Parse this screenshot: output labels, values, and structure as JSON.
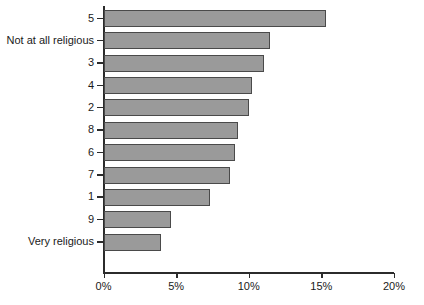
{
  "chart_data": {
    "type": "bar",
    "orientation": "horizontal",
    "title": "",
    "subtitle": "",
    "xlabel": "",
    "ylabel": "",
    "xlim": [
      0,
      20
    ],
    "ylim": null,
    "grid": false,
    "legend": null,
    "xtick_labels": [
      "0%",
      "5%",
      "10%",
      "15%",
      "20%"
    ],
    "xtick_values": [
      0,
      5,
      10,
      15,
      20
    ],
    "unit": "%",
    "categories": [
      "5",
      "Not at all religious",
      "3",
      "4",
      "2",
      "8",
      "6",
      "7",
      "1",
      "9",
      "Very religious"
    ],
    "values": [
      15.3,
      11.4,
      11.0,
      10.2,
      10.0,
      9.2,
      9.0,
      8.7,
      7.3,
      4.6,
      3.9
    ],
    "series": [
      {
        "name": "Share of respondents",
        "values": [
          15.3,
          11.4,
          11.0,
          10.2,
          10.0,
          9.2,
          9.0,
          8.7,
          7.3,
          4.6,
          3.9
        ]
      }
    ],
    "colors": {
      "bar_fill": "#9a9a9a",
      "bar_border": "#4a4a4a",
      "axis": "#2b2b2b",
      "background": "#ffffff",
      "text": "#1a1a1a"
    }
  }
}
